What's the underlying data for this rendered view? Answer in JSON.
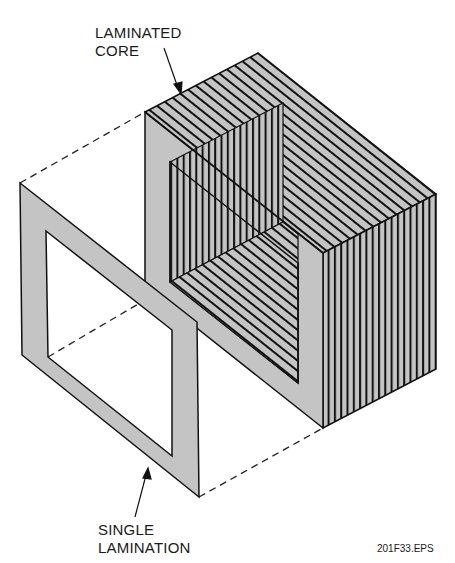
{
  "diagram": {
    "labels": {
      "core_line1": "LAMINATED",
      "core_line2": "CORE",
      "lamination_line1": "SINGLE",
      "lamination_line2": "LAMINATION"
    },
    "figure_id": "201F33.EPS",
    "colors": {
      "fill": "#c4c4c4",
      "stroke": "#111111",
      "background": "#ffffff"
    },
    "components": [
      {
        "name": "laminated-core",
        "description": "Stack of thin rectangular-frame laminations forming a box-shaped core"
      },
      {
        "name": "single-lamination",
        "description": "One thin rectangular frame shown separated in front of the core"
      },
      {
        "name": "projection-lines",
        "description": "Dashed lines connecting single lamination corners to the core"
      }
    ]
  }
}
